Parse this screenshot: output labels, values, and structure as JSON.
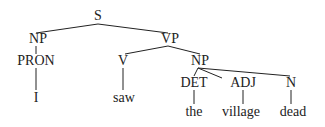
{
  "tree": {
    "nodes": [
      {
        "id": "S",
        "label": "S",
        "x": 98,
        "y": 16
      },
      {
        "id": "NP1",
        "label": "NP",
        "x": 38,
        "y": 39
      },
      {
        "id": "VP",
        "label": "VP",
        "x": 170,
        "y": 39
      },
      {
        "id": "PRON",
        "label": "PRON",
        "x": 36,
        "y": 61
      },
      {
        "id": "V",
        "label": "V",
        "x": 123,
        "y": 61
      },
      {
        "id": "NP2",
        "label": "NP",
        "x": 200,
        "y": 61
      },
      {
        "id": "DET",
        "label": "DET",
        "x": 194,
        "y": 83
      },
      {
        "id": "ADJ",
        "label": "ADJ",
        "x": 243,
        "y": 83
      },
      {
        "id": "N",
        "label": "N",
        "x": 291,
        "y": 83
      },
      {
        "id": "w_I",
        "label": "I",
        "x": 36,
        "y": 98
      },
      {
        "id": "w_saw",
        "label": "saw",
        "x": 124,
        "y": 98
      },
      {
        "id": "w_the",
        "label": "the",
        "x": 194,
        "y": 112
      },
      {
        "id": "w_village",
        "label": "village",
        "x": 241,
        "y": 112
      },
      {
        "id": "w_dead",
        "label": "dead",
        "x": 293,
        "y": 112
      }
    ],
    "edges": [
      [
        98,
        24,
        36,
        33
      ],
      [
        98,
        24,
        168,
        33
      ],
      [
        36,
        46,
        36,
        54
      ],
      [
        168,
        46,
        125,
        54
      ],
      [
        168,
        46,
        200,
        54
      ],
      [
        36,
        68,
        36,
        90
      ],
      [
        123,
        68,
        123,
        90
      ],
      [
        198,
        68,
        194,
        76
      ],
      [
        198,
        68,
        222,
        78
      ],
      [
        198,
        68,
        290,
        76
      ],
      [
        194,
        90,
        194,
        104
      ],
      [
        243,
        90,
        243,
        104
      ],
      [
        291,
        90,
        291,
        104
      ]
    ],
    "line_color": "#222222"
  }
}
